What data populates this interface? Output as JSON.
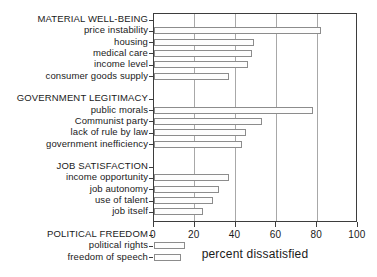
{
  "chart_data": {
    "type": "bar",
    "orientation": "horizontal",
    "title": "",
    "xlabel": "percent dissatisfied",
    "ylabel": "",
    "xlim": [
      0,
      100
    ],
    "xticks": [
      0,
      20,
      40,
      60,
      80,
      100
    ],
    "xtick_labels": [
      "0",
      "20",
      "40",
      "60",
      "80",
      "100"
    ],
    "grid": "vertical",
    "legend": "none",
    "groups": [
      {
        "name": "MATERIAL WELL-BEING",
        "items": [
          {
            "label": "price instability",
            "value": 82
          },
          {
            "label": "housing",
            "value": 49
          },
          {
            "label": "medical care",
            "value": 48
          },
          {
            "label": "income level",
            "value": 46
          },
          {
            "label": "consumer goods supply",
            "value": 37
          }
        ]
      },
      {
        "name": "GOVERNMENT LEGITIMACY",
        "items": [
          {
            "label": "public morals",
            "value": 78
          },
          {
            "label": "Communist party",
            "value": 53
          },
          {
            "label": "lack of rule by law",
            "value": 45
          },
          {
            "label": "government inefficiency",
            "value": 43
          }
        ]
      },
      {
        "name": "JOB SATISFACTION",
        "items": [
          {
            "label": "income opportunity",
            "value": 37
          },
          {
            "label": "job autonomy",
            "value": 32
          },
          {
            "label": "use of talent",
            "value": 29
          },
          {
            "label": "job itself",
            "value": 24
          }
        ]
      },
      {
        "name": "POLITICAL FREEDOM",
        "items": [
          {
            "label": "political rights",
            "value": 15
          },
          {
            "label": "freedom of speech",
            "value": 13
          }
        ]
      }
    ],
    "categories": [
      "price instability",
      "housing",
      "medical care",
      "income level",
      "consumer goods supply",
      "public morals",
      "Communist party",
      "lack of rule by law",
      "government inefficiency",
      "income opportunity",
      "job autonomy",
      "use of talent",
      "job itself",
      "political rights",
      "freedom of speech"
    ],
    "values": [
      82,
      49,
      48,
      46,
      37,
      78,
      53,
      45,
      43,
      37,
      32,
      29,
      24,
      15,
      13
    ],
    "colors": {
      "bar_fill": "#fdfdfd",
      "bar_border": "#8c8c8c",
      "axis": "#3d3d3d",
      "gridline": "#a8a8a8",
      "text": "#1a1a1a",
      "background": "#ffffff"
    }
  }
}
